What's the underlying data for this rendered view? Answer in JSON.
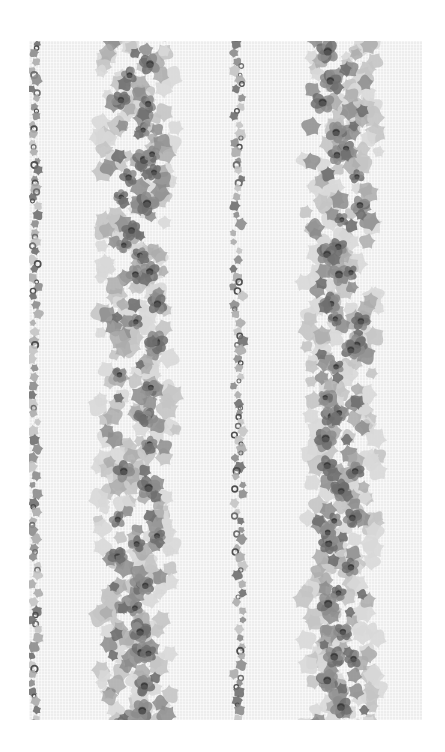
{
  "image": {
    "subject": "floral striped wallpaper sample",
    "tone": "grayscale",
    "swatch": {
      "x": 29,
      "y": 41,
      "width": 393,
      "height": 679
    },
    "background_color": "#ededed",
    "palette": {
      "dark": "#4e4e4e",
      "mid_dark": "#6f6f6f",
      "mid": "#8c8c8c",
      "light": "#acacac",
      "leaf_light": "#c4c4c4",
      "pale": "#d8d8d8"
    }
  },
  "stripes": [
    {
      "name": "left-edge-vine",
      "type": "vine",
      "center_x": 6,
      "width": 14,
      "seed": 11
    },
    {
      "name": "floral-stripe-1",
      "type": "garland",
      "center_x": 108,
      "width": 82,
      "seed": 23
    },
    {
      "name": "center-vine",
      "type": "vine",
      "center_x": 209,
      "width": 20,
      "seed": 37
    },
    {
      "name": "floral-stripe-2",
      "type": "garland",
      "center_x": 312,
      "width": 80,
      "seed": 51
    }
  ]
}
